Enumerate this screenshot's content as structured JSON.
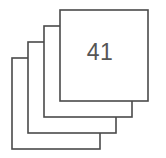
{
  "figure": {
    "name": "stacked-squares-count",
    "background_color": "#ffffff",
    "stroke_color": "#4a4a4a",
    "stroke_width": 1.6,
    "fill_color": "#ffffff",
    "text_color": "#555555"
  },
  "count_label": {
    "value": "41",
    "center_x": 100,
    "center_y": 54,
    "font_size": 23
  },
  "squares": [
    {
      "id": "square-back-4",
      "x": 12,
      "y": 58,
      "width": 88,
      "height": 91,
      "z": 1
    },
    {
      "id": "square-back-3",
      "x": 28,
      "y": 42,
      "width": 88,
      "height": 91,
      "z": 2
    },
    {
      "id": "square-back-2",
      "x": 44,
      "y": 26,
      "width": 88,
      "height": 91,
      "z": 3
    },
    {
      "id": "square-front-1",
      "x": 60,
      "y": 10,
      "width": 88,
      "height": 91,
      "z": 4
    }
  ],
  "geometry": {
    "offset_x": -16,
    "offset_y": 16,
    "square_count": 4,
    "canvas_width": 166,
    "canvas_height": 158
  }
}
